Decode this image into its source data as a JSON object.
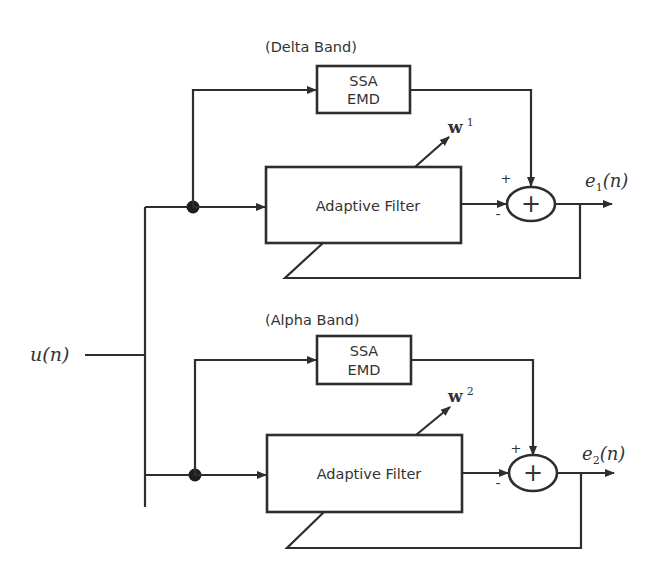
{
  "diagram": {
    "input": {
      "label": "u(n)"
    },
    "branches": [
      {
        "band_label": "(Delta Band)",
        "ssa_box": {
          "line1": "SSA",
          "line2": "EMD"
        },
        "filter_box": {
          "label": "Adaptive Filter"
        },
        "weight": {
          "symbol": "w",
          "superscript": "1"
        },
        "summer": {
          "plus_sign": "+",
          "minus_sign": "-",
          "glyph": "+"
        },
        "output": {
          "symbol": "e",
          "subscript": "1",
          "arg": "(n)"
        }
      },
      {
        "band_label": "(Alpha Band)",
        "ssa_box": {
          "line1": "SSA",
          "line2": "EMD"
        },
        "filter_box": {
          "label": "Adaptive Filter"
        },
        "weight": {
          "symbol": "w",
          "superscript": "2"
        },
        "summer": {
          "plus_sign": "+",
          "minus_sign": "-",
          "glyph": "+"
        },
        "output": {
          "symbol": "e",
          "subscript": "2",
          "arg": "(n)"
        }
      }
    ],
    "colors": {
      "stroke": "#2e2e2e",
      "text": "#333333",
      "background": "#ffffff"
    }
  }
}
